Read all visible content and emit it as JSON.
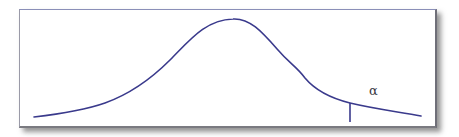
{
  "diagram": {
    "type": "distribution-curve",
    "curve_color": "#3a3a8c",
    "frame_border_color": "#8a8fb8",
    "tail_label": "α",
    "curve_points": [
      [
        34,
        117
      ],
      [
        70,
        112
      ],
      [
        100,
        105
      ],
      [
        130,
        92
      ],
      [
        160,
        69
      ],
      [
        190,
        38
      ],
      [
        220,
        20
      ],
      [
        233,
        19
      ],
      [
        240,
        21
      ],
      [
        260,
        33
      ],
      [
        280,
        52
      ],
      [
        295,
        64
      ],
      [
        310,
        84
      ],
      [
        330,
        96
      ],
      [
        350,
        103
      ],
      [
        380,
        109
      ],
      [
        421,
        116
      ]
    ],
    "cutoff_line": {
      "x": 350,
      "y_top": 103,
      "y_bottom": 122
    }
  }
}
